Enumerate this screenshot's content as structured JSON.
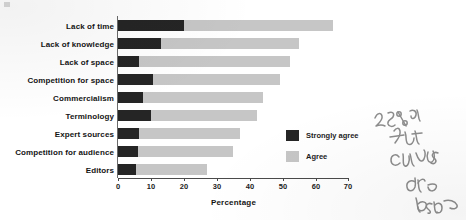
{
  "chart_data": {
    "type": "bar",
    "orientation": "horizontal",
    "stacked": true,
    "title": "",
    "xlabel": "Percentage",
    "ylabel": "",
    "xlim": [
      0,
      70
    ],
    "xticks": [
      0,
      10,
      20,
      30,
      40,
      50,
      60,
      70
    ],
    "grid": false,
    "legend_position": "inside lower-right",
    "categories": [
      "Lack of time",
      "Lack of knowledge",
      "Lack of space",
      "Competition for space",
      "Commercialism",
      "Terminology",
      "Expert sources",
      "Competition for audience",
      "Editors"
    ],
    "series": [
      {
        "name": "Strongly agree",
        "color": "#252525",
        "values": [
          20,
          13,
          6.5,
          10.5,
          7.5,
          10,
          6.5,
          6,
          5.5
        ]
      },
      {
        "name": "Agree",
        "color": "#c6c6c6",
        "values": [
          45,
          42,
          45.5,
          38.5,
          36.5,
          32,
          30.5,
          29,
          21.5
        ]
      }
    ],
    "totals": [
      65,
      55,
      52,
      49,
      44,
      42,
      37,
      35,
      27
    ]
  },
  "axis": {
    "x_title": "Percentage",
    "tick_labels": [
      "0",
      "10",
      "20",
      "30",
      "40",
      "50",
      "60",
      "70"
    ]
  },
  "legend": {
    "items": [
      {
        "label": "Strongly agree",
        "swatch": "dark-swatch-icon"
      },
      {
        "label": "Agree",
        "swatch": "light-swatch-icon"
      }
    ]
  },
  "annotation": {
    "handwriting_text": "25% of that canvas are band",
    "style": "handwritten pencil margin note"
  },
  "colors": {
    "strongly_agree": "#252525",
    "agree": "#c6c6c6",
    "axis": "#4a4a4a",
    "text": "#141414",
    "background": "#ffffff"
  }
}
